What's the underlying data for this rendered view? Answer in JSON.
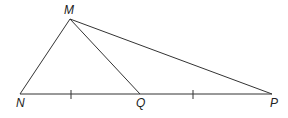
{
  "diagram": {
    "type": "geometry-triangle",
    "line_color": "#333333",
    "label_color": "#222222",
    "points": {
      "M": {
        "label": "M"
      },
      "N": {
        "label": "N"
      },
      "Q": {
        "label": "Q"
      },
      "P": {
        "label": "P"
      }
    },
    "segments": [
      "MN",
      "MQ",
      "MP",
      "NQ",
      "QP"
    ],
    "tick_marks": [
      {
        "segment": "NQ",
        "count": 1
      },
      {
        "segment": "QP",
        "count": 1
      }
    ]
  }
}
